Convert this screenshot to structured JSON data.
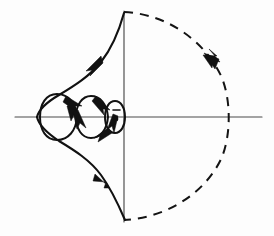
{
  "figure": {
    "background_color": "#fdfdfd",
    "ink_color": "#111111",
    "axis_color": "#4a4a4a",
    "width": 274,
    "height": 236
  },
  "axes": {
    "real_axis": {
      "label": "real-axis",
      "x_start": 15,
      "x_end": 262,
      "y": 117
    },
    "imaginary_axis": {
      "label": "imaginary-axis",
      "x": 124,
      "y_start": 11,
      "y_end": 222
    },
    "origin": {
      "x": 124,
      "y": 117
    }
  },
  "markers": {
    "critical_point": {
      "x": 116,
      "y": 119,
      "radius": 2.4,
      "label": "critical-point-dot"
    }
  },
  "chart_data": {
    "type": "line",
    "xlabel": "Re",
    "ylabel": "Im",
    "grid": false,
    "legend": false,
    "xlim": [
      15,
      262
    ],
    "ylim": [
      11,
      222
    ],
    "series": [
      {
        "name": "outer-locus-upper",
        "style": "solid",
        "points": [
          [
            123,
            12
          ],
          [
            118,
            26
          ],
          [
            110,
            42
          ],
          [
            100,
            58
          ],
          [
            88,
            72
          ],
          [
            72,
            84
          ],
          [
            56,
            94
          ],
          [
            44,
            104
          ],
          [
            38,
            112
          ],
          [
            37,
            117
          ]
        ]
      },
      {
        "name": "outer-locus-lower",
        "style": "solid",
        "points": [
          [
            37,
            117
          ],
          [
            38,
            124
          ],
          [
            44,
            134
          ],
          [
            56,
            146
          ],
          [
            72,
            158
          ],
          [
            88,
            170
          ],
          [
            100,
            186
          ],
          [
            110,
            200
          ],
          [
            118,
            212
          ],
          [
            124,
            219
          ]
        ]
      },
      {
        "name": "loop-1-large",
        "style": "solid",
        "points": [
          [
            76,
            117
          ],
          [
            72,
            102
          ],
          [
            62,
            95
          ],
          [
            50,
            97
          ],
          [
            43,
            106
          ],
          [
            42,
            117
          ],
          [
            44,
            128
          ],
          [
            52,
            137
          ],
          [
            64,
            138
          ],
          [
            73,
            131
          ],
          [
            76,
            117
          ]
        ]
      },
      {
        "name": "loop-2-medium",
        "style": "solid",
        "points": [
          [
            108,
            117
          ],
          [
            104,
            104
          ],
          [
            95,
            97
          ],
          [
            85,
            99
          ],
          [
            78,
            107
          ],
          [
            76,
            117
          ],
          [
            79,
            128
          ],
          [
            87,
            136
          ],
          [
            98,
            135
          ],
          [
            106,
            128
          ],
          [
            108,
            117
          ]
        ]
      },
      {
        "name": "loop-3-small",
        "style": "solid",
        "points": [
          [
            124,
            117
          ],
          [
            122,
            108
          ],
          [
            117,
            103
          ],
          [
            111,
            105
          ],
          [
            107,
            111
          ],
          [
            107,
            118
          ],
          [
            110,
            126
          ],
          [
            116,
            129
          ],
          [
            122,
            125
          ],
          [
            124,
            117
          ]
        ]
      },
      {
        "name": "infinite-semicircle",
        "style": "dashed",
        "points": [
          [
            124,
            12
          ],
          [
            160,
            18
          ],
          [
            196,
            38
          ],
          [
            220,
            68
          ],
          [
            228,
            105
          ],
          [
            228,
            117
          ],
          [
            226,
            146
          ],
          [
            212,
            178
          ],
          [
            188,
            204
          ],
          [
            156,
            218
          ],
          [
            124,
            220
          ]
        ]
      }
    ],
    "annotations": [
      {
        "name": "arrow-upper-locus",
        "x": 95,
        "y": 63,
        "direction": "up-right",
        "angle": -47
      },
      {
        "name": "arrow-lower-locus",
        "x": 100,
        "y": 181,
        "direction": "up-left",
        "angle": -133
      },
      {
        "name": "arrow-dashed-arc",
        "x": 212,
        "y": 62,
        "direction": "down-right",
        "angle": 56
      },
      {
        "name": "arrow-loop-1-down",
        "x": 76,
        "y": 122,
        "direction": "down-left",
        "angle": 115
      },
      {
        "name": "arrow-loop-1-right",
        "x": 72,
        "y": 106,
        "direction": "down-right",
        "angle": 55
      },
      {
        "name": "arrow-loop-2-down",
        "x": 84,
        "y": 128,
        "direction": "down-right",
        "angle": 70
      },
      {
        "name": "arrow-loop-2-right",
        "x": 103,
        "y": 107,
        "direction": "down-right",
        "angle": 60
      },
      {
        "name": "arrow-loop-3-down",
        "x": 112,
        "y": 128,
        "direction": "down-left",
        "angle": 120
      },
      {
        "name": "arrow-loop-3-top",
        "x": 120,
        "y": 107,
        "direction": "left",
        "angle": 185
      }
    ]
  },
  "elements": {
    "real_axis_name": "real-axis-line",
    "imaginary_axis_name": "imaginary-axis-line",
    "locus_name": "nyquist-locus-solid",
    "arc_name": "infinite-radius-arc-dashed",
    "loops_group_name": "spiral-loops-group",
    "arrows_group_name": "direction-arrows-group"
  }
}
